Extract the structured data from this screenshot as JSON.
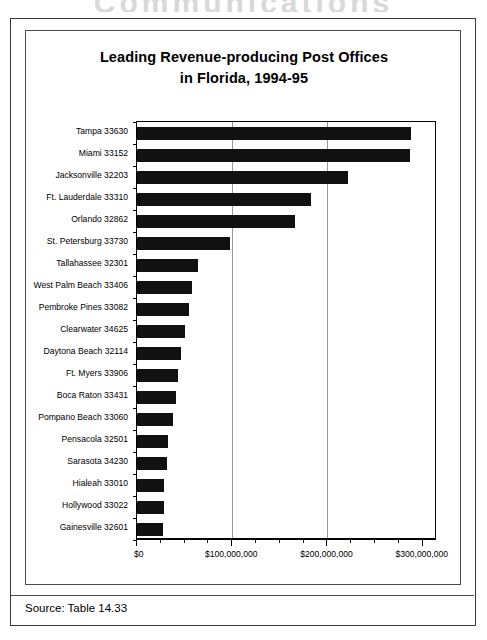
{
  "page": {
    "heading_partial": "Communications",
    "source_note": "Source:  Table 14.33"
  },
  "chart_data": {
    "type": "bar",
    "orientation": "horizontal",
    "title": "Leading Revenue-producing Post Offices",
    "subtitle": "in Florida, 1994-95",
    "title_full": "Leading Revenue-producing Post Offices in Florida, 1994-95",
    "xlabel": "",
    "ylabel": "",
    "xlim": [
      0,
      315000000
    ],
    "grid": "vertical",
    "gridlines": [
      100000000,
      200000000
    ],
    "legend": "none",
    "bar_color": "#111111",
    "tick_labels": [
      "$0",
      "$100,000,000",
      "$200,000,000",
      "$300,000,000"
    ],
    "ticks": [
      0,
      100000000,
      200000000,
      300000000
    ],
    "minor_tick_interval": 25000000,
    "categories": [
      "Tampa 33630",
      "Miami 33152",
      "Jacksonville 32203",
      "Ft. Lauderdale 33310",
      "Orlando 32862",
      "St. Petersburg 33730",
      "Tallahassee 32301",
      "West Palm Beach 33406",
      "Pembroke Pines 33082",
      "Clearwater 34625",
      "Daytona Beach 32114",
      "Ft. Myers 33906",
      "Boca Raton 33431",
      "Pompano Beach 33060",
      "Pensacola 32501",
      "Sarasota 34230",
      "Hialeah 33010",
      "Hollywood 33022",
      "Gainesville 32601"
    ],
    "values": [
      288000000,
      287000000,
      222000000,
      183000000,
      166000000,
      98000000,
      64000000,
      58000000,
      55000000,
      50000000,
      46000000,
      43000000,
      41000000,
      38000000,
      33000000,
      31000000,
      28000000,
      28000000,
      27000000
    ]
  }
}
